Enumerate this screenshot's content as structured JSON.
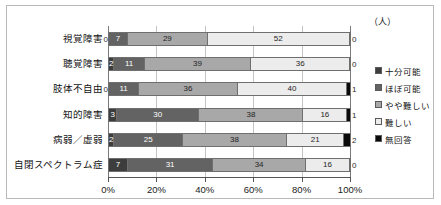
{
  "unit_label": "（人）",
  "chart_data": {
    "type": "bar",
    "subtype": "stacked-horizontal-100pct",
    "title": "",
    "xlabel": "",
    "ylabel": "",
    "xlim": [
      0,
      100
    ],
    "xticks": [
      "0%",
      "20%",
      "40%",
      "60%",
      "80%",
      "100%"
    ],
    "xtick_values": [
      0,
      20,
      40,
      60,
      80,
      100
    ],
    "grid": true,
    "legend_position": "right",
    "value_unit": "（人）",
    "row_total": 88,
    "categories": [
      "視覚障害",
      "聴覚障害",
      "肢体不自由",
      "知的障害",
      "病弱／虚弱",
      "自閉スペクトラム症"
    ],
    "series": [
      {
        "name": "十分可能",
        "color": "#3d3d3d",
        "values": [
          0,
          2,
          0,
          3,
          2,
          7
        ]
      },
      {
        "name": "ほぼ可能",
        "color": "#636363",
        "values": [
          7,
          11,
          11,
          30,
          25,
          31
        ]
      },
      {
        "name": "やや難しい",
        "color": "#a8a8a8",
        "values": [
          29,
          39,
          36,
          38,
          38,
          34
        ]
      },
      {
        "name": "難しい",
        "color": "#ececec",
        "values": [
          52,
          36,
          40,
          16,
          21,
          16
        ]
      },
      {
        "name": "無回答",
        "color": "#0a0a0a",
        "values": [
          0,
          0,
          1,
          1,
          2,
          0
        ]
      }
    ]
  },
  "legend": {
    "items": [
      {
        "label": "十分可能",
        "swatch": "s0"
      },
      {
        "label": "ほぼ可能",
        "swatch": "s1"
      },
      {
        "label": "やや難しい",
        "swatch": "s2"
      },
      {
        "label": "難しい",
        "swatch": "s3"
      },
      {
        "label": "無回答",
        "swatch": "s4"
      }
    ]
  }
}
